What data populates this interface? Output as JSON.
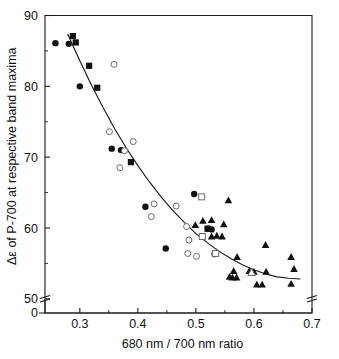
{
  "figure": {
    "width": 339,
    "height": 359,
    "background": "#ffffff",
    "ink_color": "#111111",
    "open_marker_stroke": "#6d6d6d"
  },
  "chart_data": {
    "type": "scatter",
    "title": "",
    "subtitle": "",
    "xlabel": "680 nm / 700 nm  ratio",
    "ylabel": "Δε of P-700 at respective band maxima",
    "xlim": [
      0.24,
      0.7
    ],
    "ylim": [
      48.0,
      90.0
    ],
    "xticks": [
      0.3,
      0.4,
      0.5,
      0.6,
      0.7
    ],
    "xtick_labels": [
      "0.3",
      "0.4",
      "0.5",
      "0.6",
      "0.7"
    ],
    "xticks_minor": [
      0.35,
      0.45,
      0.55,
      0.65
    ],
    "yticks": [
      50,
      60,
      70,
      80,
      90
    ],
    "ytick_labels": [
      "50",
      "60",
      "70",
      "80",
      "90"
    ],
    "yticks_minor": [
      55,
      65,
      75,
      85
    ],
    "origin_label": "0",
    "grid": false,
    "legend": "none",
    "axis_break_y": true,
    "axis_break_x_right": true,
    "frame": "box",
    "series": [
      {
        "name": "filled-circle",
        "marker": "filled-circle",
        "points": [
          [
            0.258,
            86.1
          ],
          [
            0.281,
            86.0
          ],
          [
            0.3,
            80.0
          ],
          [
            0.355,
            71.2
          ],
          [
            0.371,
            71.0
          ],
          [
            0.413,
            63.0
          ],
          [
            0.448,
            57.1
          ],
          [
            0.497,
            64.8
          ],
          [
            0.521,
            59.9
          ],
          [
            0.527,
            59.8
          ]
        ]
      },
      {
        "name": "filled-square",
        "marker": "filled-square",
        "points": [
          [
            0.288,
            87.1
          ],
          [
            0.293,
            86.2
          ],
          [
            0.316,
            82.9
          ],
          [
            0.33,
            79.8
          ],
          [
            0.388,
            69.3
          ],
          [
            0.52,
            59.9
          ]
        ]
      },
      {
        "name": "open-circle",
        "marker": "open-circle",
        "points": [
          [
            0.359,
            83.1
          ],
          [
            0.351,
            73.6
          ],
          [
            0.392,
            72.2
          ],
          [
            0.377,
            70.9
          ],
          [
            0.369,
            68.5
          ],
          [
            0.428,
            63.4
          ],
          [
            0.466,
            63.1
          ],
          [
            0.423,
            61.6
          ],
          [
            0.484,
            60.2
          ],
          [
            0.488,
            58.3
          ],
          [
            0.486,
            56.4
          ],
          [
            0.501,
            56.0
          ],
          [
            0.532,
            56.3
          ]
        ]
      },
      {
        "name": "open-square",
        "marker": "open-square",
        "points": [
          [
            0.51,
            64.4
          ],
          [
            0.511,
            58.8
          ],
          [
            0.534,
            56.4
          ]
        ]
      },
      {
        "name": "filled-triangle",
        "marker": "filled-triangle",
        "points": [
          [
            0.556,
            63.9
          ],
          [
            0.512,
            61.0
          ],
          [
            0.527,
            61.1
          ],
          [
            0.499,
            60.4
          ],
          [
            0.548,
            60.5
          ],
          [
            0.527,
            58.8
          ],
          [
            0.536,
            58.9
          ],
          [
            0.545,
            58.8
          ],
          [
            0.62,
            57.6
          ],
          [
            0.571,
            55.9
          ],
          [
            0.664,
            55.9
          ],
          [
            0.565,
            53.9
          ],
          [
            0.592,
            53.9
          ],
          [
            0.6,
            53.8
          ],
          [
            0.621,
            53.8
          ],
          [
            0.669,
            54.2
          ],
          [
            0.558,
            53.1
          ],
          [
            0.563,
            53.0
          ],
          [
            0.57,
            53.0
          ],
          [
            0.605,
            52.0
          ],
          [
            0.614,
            52.0
          ],
          [
            0.664,
            52.1
          ]
        ]
      },
      {
        "name": "open-triangle",
        "marker": "open-triangle",
        "points": [
          [
            0.596,
            53.7
          ]
        ]
      }
    ],
    "fit_curve": {
      "name": "exponential-decay-fit",
      "description": "monotonically decreasing fitted curve through the scatter",
      "points": [
        [
          0.279,
          87.4
        ],
        [
          0.3,
          83.6
        ],
        [
          0.32,
          80.2
        ],
        [
          0.34,
          77.0
        ],
        [
          0.36,
          74.0
        ],
        [
          0.38,
          71.3
        ],
        [
          0.4,
          68.8
        ],
        [
          0.42,
          66.5
        ],
        [
          0.44,
          64.4
        ],
        [
          0.46,
          62.5
        ],
        [
          0.48,
          60.8
        ],
        [
          0.5,
          59.2
        ],
        [
          0.52,
          57.9
        ],
        [
          0.54,
          56.7
        ],
        [
          0.56,
          55.7
        ],
        [
          0.58,
          54.8
        ],
        [
          0.6,
          54.1
        ],
        [
          0.62,
          53.5
        ],
        [
          0.64,
          53.1
        ],
        [
          0.66,
          52.9
        ],
        [
          0.68,
          52.8
        ]
      ]
    }
  }
}
